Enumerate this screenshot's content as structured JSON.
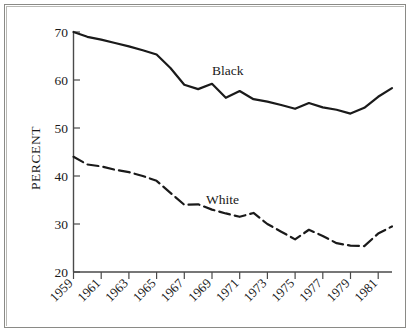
{
  "figure": {
    "axis_label_y": "PERCENT",
    "border_color": "#8a8a86",
    "line_color": "#1a1a1a",
    "background": "#ffffff"
  },
  "axes": {
    "y_ticks": [
      "70",
      "60",
      "50",
      "40",
      "30",
      "20"
    ],
    "y_min": 20,
    "y_max": 70,
    "x_ticks": [
      "1959",
      "1961",
      "1963",
      "1965",
      "1967",
      "1969",
      "1971",
      "1973",
      "1975",
      "1977",
      "1979",
      "1981"
    ],
    "x_min": 1959,
    "x_max": 1982
  },
  "labels": {
    "black": "Black",
    "white": "White"
  },
  "chart_data": {
    "type": "line",
    "title": "",
    "xlabel": "",
    "ylabel": "PERCENT",
    "ylim": [
      20,
      70
    ],
    "xlim": [
      1959,
      1982
    ],
    "grid": false,
    "legend": "inline-annotation",
    "x": [
      1959,
      1960,
      1961,
      1962,
      1963,
      1964,
      1965,
      1966,
      1967,
      1968,
      1969,
      1970,
      1971,
      1972,
      1973,
      1974,
      1975,
      1976,
      1977,
      1978,
      1979,
      1980,
      1981,
      1982
    ],
    "series": [
      {
        "name": "Black",
        "style": "solid",
        "values": [
          70.0,
          69.0,
          68.4,
          67.7,
          67.0,
          66.2,
          65.3,
          62.5,
          59.0,
          58.1,
          59.2,
          56.3,
          57.7,
          56.0,
          55.5,
          54.8,
          54.0,
          55.2,
          54.3,
          53.8,
          53.0,
          54.2,
          56.5,
          58.3
        ]
      },
      {
        "name": "White",
        "style": "dashed",
        "values": [
          44.0,
          42.4,
          42.0,
          41.3,
          40.8,
          40.0,
          39.0,
          36.5,
          34.0,
          34.1,
          33.0,
          32.2,
          31.5,
          32.3,
          30.0,
          28.4,
          26.8,
          28.8,
          27.5,
          26.0,
          25.5,
          25.4,
          28.0,
          29.5
        ]
      }
    ]
  }
}
